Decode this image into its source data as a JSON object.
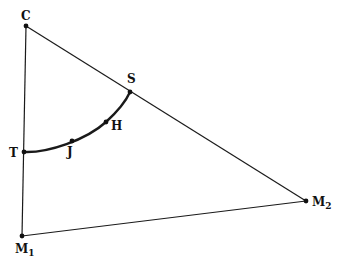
{
  "diagram": {
    "type": "geometric-figure",
    "stroke_color": "#1a1a1a",
    "points": {
      "C": {
        "label": "C",
        "x": 26,
        "y": 26
      },
      "S": {
        "label": "S",
        "x": 130,
        "y": 92
      },
      "H": {
        "label": "H",
        "x": 106,
        "y": 122
      },
      "J": {
        "label": "J",
        "x": 72,
        "y": 141
      },
      "T": {
        "label": "T",
        "x": 24,
        "y": 152
      },
      "M1": {
        "label": "M",
        "subscript": "1",
        "x": 22,
        "y": 236
      },
      "M2": {
        "label": "M",
        "subscript": "2",
        "x": 306,
        "y": 201
      }
    },
    "segments": [
      {
        "from": "C",
        "to": "M1"
      },
      {
        "from": "C",
        "to": "M2"
      },
      {
        "from": "M1",
        "to": "M2"
      }
    ],
    "arcs": [
      {
        "through": [
          "T",
          "J",
          "H",
          "S"
        ],
        "style": "bold"
      }
    ]
  }
}
